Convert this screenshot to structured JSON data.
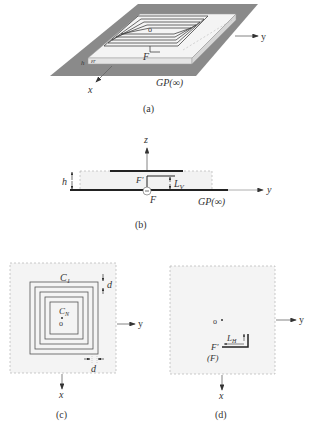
{
  "panels": {
    "a": {
      "caption": "(a)",
      "labels": {
        "origin": "o",
        "feed": "F",
        "height": "h",
        "permittivity": "εr",
        "ground_plane": "GP(∞)",
        "axis_x": "x",
        "axis_y": "y"
      }
    },
    "b": {
      "caption": "(b)",
      "labels": {
        "axis_z": "z",
        "axis_y": "y",
        "height": "h",
        "feed_top": "F'",
        "feed_bottom": "F",
        "vertical_length": "L",
        "vertical_length_sub": "V",
        "ground_plane": "GP(∞)"
      }
    },
    "c": {
      "caption": "(c)",
      "labels": {
        "outer_coil": "C",
        "outer_coil_sub": "1",
        "inner_coil": "C",
        "inner_coil_sub": "N",
        "origin": "o",
        "spacing_top": "d",
        "spacing_bottom": "d",
        "axis_x": "x",
        "axis_y": "y"
      }
    },
    "d": {
      "caption": "(d)",
      "labels": {
        "origin": "o",
        "horizontal_length": "L",
        "horizontal_length_sub": "H",
        "feed_top": "F'",
        "feed_bottom": "(F)",
        "axis_x": "x",
        "axis_y": "y"
      }
    }
  },
  "colors": {
    "ground_plane": "#8a8a8a",
    "substrate": "#f2f2f2",
    "substrate_side": "#e2e2e2",
    "line": "#333333",
    "dashed": "#aaaaaa",
    "panel_fill": "#f4f4f4"
  }
}
